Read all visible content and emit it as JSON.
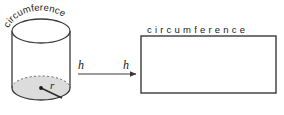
{
  "figure": {
    "title_hidden": "Cylinder unrolled into rectangle (lateral surface area)",
    "background_color": "#ffffff",
    "stroke_color": "#3a3a3a",
    "shade_color": "#dcdcdc",
    "width": 284,
    "height": 115
  },
  "cylinder": {
    "curved_label": "circumference",
    "curved_label_chars": [
      "c",
      "i",
      "r",
      "c",
      "u",
      "m",
      "f",
      "e",
      "r",
      "e",
      "n",
      "c",
      "e"
    ],
    "height_label": "h",
    "radius_label": "r",
    "left_x": 12,
    "right_x": 70,
    "top_ellipse_cy": 31,
    "bottom_ellipse_cy": 88,
    "ellipse_rx": 29,
    "ellipse_ry": 12,
    "top_face_fill": "#ffffff",
    "bottom_face_fill": "#dcdcdc",
    "hidden_edge_style": "dashed"
  },
  "arrow": {
    "label_left": "h",
    "label_right": "h",
    "x1": 78,
    "x2": 136,
    "y": 74,
    "direction": "right"
  },
  "rectangle": {
    "top_label": "circumference",
    "side_label": "h",
    "x": 141,
    "y": 36,
    "width": 135,
    "height": 57,
    "fill": "#ffffff",
    "stroke": "#3a3a3a",
    "letter_spacing_px": 3.2
  }
}
